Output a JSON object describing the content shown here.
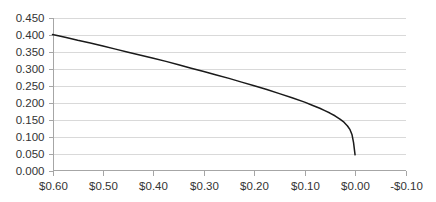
{
  "chart_data": {
    "type": "line",
    "title": "",
    "subtitle": "",
    "xlabel": "",
    "ylabel": "",
    "grid": true,
    "legend": false,
    "legend_position": "none",
    "x_axis_reversed": true,
    "xlim": [
      -0.1,
      0.6
    ],
    "ylim": [
      0.0,
      0.45
    ],
    "x_tick_labels": [
      "$0.60",
      "$0.50",
      "$0.40",
      "$0.30",
      "$0.20",
      "$0.10",
      "$0.00",
      "-$0.10"
    ],
    "x_tick_values": [
      0.6,
      0.5,
      0.4,
      0.3,
      0.2,
      0.1,
      0.0,
      -0.1
    ],
    "y_tick_labels": [
      "0.450",
      "0.400",
      "0.350",
      "0.300",
      "0.250",
      "0.200",
      "0.150",
      "0.100",
      "0.050",
      "0.000"
    ],
    "y_tick_values": [
      0.45,
      0.4,
      0.35,
      0.3,
      0.25,
      0.2,
      0.15,
      0.1,
      0.05,
      0.0
    ],
    "series": [
      {
        "name": "curve",
        "color": "#1a1a1a",
        "x": [
          0.6,
          0.575,
          0.55,
          0.525,
          0.5,
          0.475,
          0.45,
          0.425,
          0.4,
          0.375,
          0.35,
          0.325,
          0.3,
          0.275,
          0.25,
          0.225,
          0.2,
          0.175,
          0.15,
          0.125,
          0.1,
          0.085,
          0.07,
          0.06,
          0.05,
          0.04,
          0.03,
          0.022,
          0.015,
          0.01,
          0.006,
          0.003,
          0.0
        ],
        "y": [
          0.4,
          0.392,
          0.383,
          0.375,
          0.366,
          0.357,
          0.348,
          0.339,
          0.33,
          0.321,
          0.311,
          0.301,
          0.291,
          0.281,
          0.271,
          0.26,
          0.249,
          0.238,
          0.226,
          0.214,
          0.201,
          0.192,
          0.183,
          0.176,
          0.169,
          0.161,
          0.151,
          0.142,
          0.131,
          0.12,
          0.105,
          0.082,
          0.046
        ]
      }
    ]
  },
  "plot": {
    "background_color": "#ffffff",
    "gridline_color": "#d9d9d9",
    "axis_color": "#a6a6a6",
    "label_color": "#333333"
  }
}
